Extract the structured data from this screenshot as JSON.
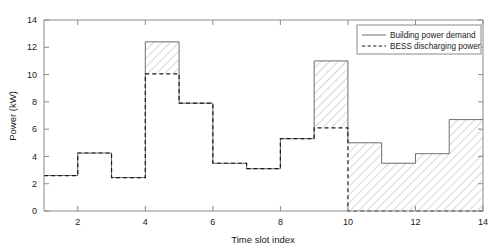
{
  "chart_data": {
    "type": "area",
    "title": "",
    "xlabel": "Time slot index",
    "ylabel": "Power (kW)",
    "xlim": [
      1,
      14
    ],
    "ylim": [
      0,
      14
    ],
    "xticks": [
      2,
      4,
      6,
      8,
      10,
      12,
      14
    ],
    "yticks": [
      0,
      2,
      4,
      6,
      8,
      10,
      12,
      14
    ],
    "grid": false,
    "legend_position": "top-right",
    "step_style": "post",
    "slots": [
      1,
      2,
      3,
      4,
      5,
      6,
      7,
      8,
      9,
      10,
      11,
      12,
      13,
      14
    ],
    "series": [
      {
        "name": "Building power demand",
        "style": "solid",
        "color": "#6e6e6e",
        "values": [
          2.6,
          4.25,
          2.45,
          12.4,
          7.9,
          3.5,
          3.1,
          5.3,
          11.0,
          5.0,
          3.5,
          4.2,
          6.7
        ]
      },
      {
        "name": "BESS discharging power",
        "style": "dashed",
        "color": "#1a1a1a",
        "values": [
          2.6,
          4.25,
          2.45,
          10.05,
          7.9,
          3.5,
          3.1,
          5.3,
          6.1,
          0,
          0,
          0,
          0
        ]
      }
    ],
    "hatched_region_label": "difference between building power demand and BESS discharging power"
  },
  "legend": {
    "entries": [
      {
        "label": "Building power demand",
        "style": "solid"
      },
      {
        "label": "BESS discharging power",
        "style": "dashed"
      }
    ]
  },
  "axes": {
    "y_label": "Power (kW)",
    "x_label": "Time slot index",
    "y_tick_labels": [
      "0",
      "2",
      "4",
      "6",
      "8",
      "10",
      "12",
      "14"
    ],
    "x_tick_labels": [
      "2",
      "4",
      "6",
      "8",
      "10",
      "12",
      "14"
    ]
  }
}
